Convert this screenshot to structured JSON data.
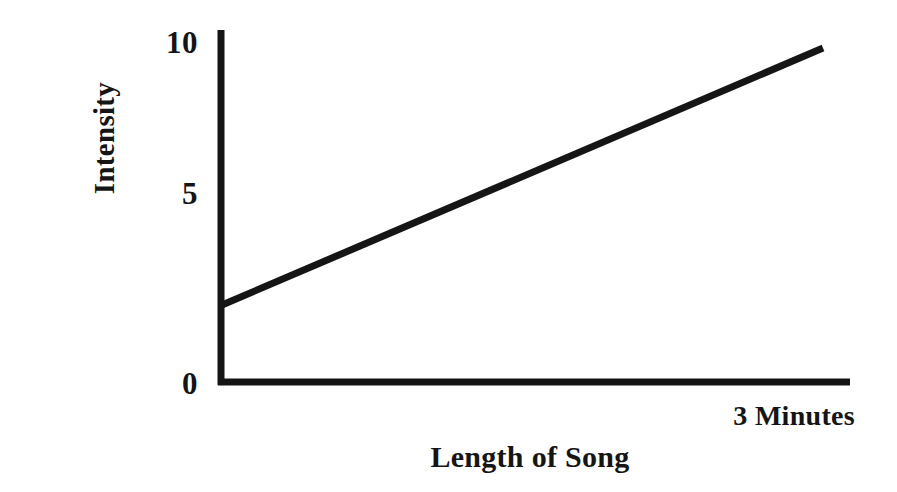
{
  "chart_data": {
    "type": "line",
    "title": "",
    "subtitle": "",
    "xlabel": "Length of Song",
    "ylabel": "Intensity",
    "grid": false,
    "legend": false,
    "legend_position": "none",
    "axis_color": "#151515",
    "line_color": "#151515",
    "background_color": "#ffffff",
    "xlim": [
      0,
      3
    ],
    "ylim": [
      0,
      10
    ],
    "x_tick_labels": [],
    "x_annotation": "3 Minutes",
    "y_ticks": [
      {
        "label": "10",
        "value": 10,
        "pixel_y": 42
      },
      {
        "label": "5",
        "value": 5,
        "pixel_y": 193
      },
      {
        "label": "0",
        "value": 0,
        "pixel_y": 383
      }
    ],
    "series": [
      {
        "name": "Intensity over song length",
        "x": [
          0,
          3
        ],
        "values": [
          2,
          9.8
        ],
        "line_width": 7,
        "style": "solid"
      }
    ],
    "annotations": [
      {
        "text": "3 Minutes",
        "position": "x-axis-right-end"
      }
    ]
  },
  "geometry": {
    "axis_origin_x": 220,
    "axis_origin_y": 383,
    "y_axis_top": 30,
    "x_axis_right": 850,
    "line_start": {
      "x": 222,
      "y": 305
    },
    "line_end": {
      "x": 823,
      "y": 48
    },
    "axis_stroke_width": 7
  }
}
